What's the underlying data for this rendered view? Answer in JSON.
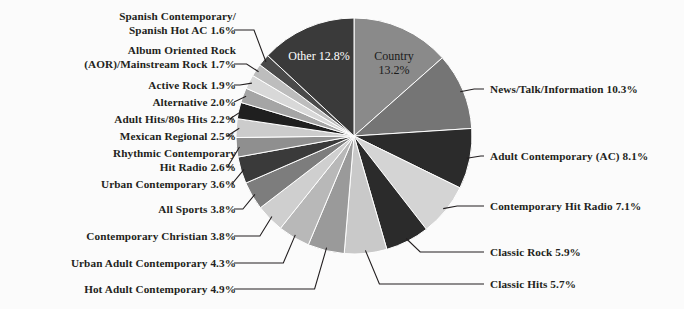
{
  "chart_data": {
    "type": "pie",
    "title": "",
    "subtitle": "",
    "xlabel": "",
    "ylabel": "",
    "legend_position": "none",
    "grid": false,
    "units": "percent",
    "background_color": "#fbfbfb",
    "text_color": "#231f20",
    "start_angle_deg": 0,
    "direction": "clockwise",
    "categories": [
      "Country",
      "News/Talk/Information",
      "Adult Contemporary (AC)",
      "Contemporary Hit Radio",
      "Classic Rock",
      "Classic Hits",
      "Hot Adult Contemporary",
      "Urban Adult Contemporary",
      "Contemporary Christian",
      "All Sports",
      "Urban Contemporary",
      "Rhythmic Contemporary Hit Radio",
      "Mexican Regional",
      "Adult Hits/80s Hits",
      "Alternative",
      "Active Rock",
      "Album Oriented Rock (AOR)/Mainstream Rock",
      "Spanish Contemporary/Spanish Hot AC",
      "Other"
    ],
    "values": [
      13.2,
      10.3,
      8.1,
      7.1,
      5.9,
      5.7,
      4.9,
      4.3,
      3.8,
      3.8,
      3.6,
      2.6,
      2.5,
      2.2,
      2.0,
      1.9,
      1.7,
      1.6,
      12.8
    ],
    "colors": [
      "#8a8a8a",
      "#757575",
      "#2b2b2b",
      "#d4d4d4",
      "#2b2b2b",
      "#c9c9c9",
      "#9a9a9a",
      "#b8b8b8",
      "#cfcfcf",
      "#7d7d7d",
      "#3a3a3a",
      "#8f8f8f",
      "#cccccc",
      "#1f1f1f",
      "#a5a5a5",
      "#d8d8d8",
      "#bdbdbd",
      "#4a4a4a",
      "#3a3a3a"
    ],
    "slices": [
      {
        "label": "Country",
        "value": 13.2,
        "display": "Country\n13.2%",
        "color": "#8a8a8a",
        "label_style": "inside-dark"
      },
      {
        "label": "News/Talk/Information",
        "value": 10.3,
        "display": "News/Talk/Information 10.3%",
        "color": "#757575",
        "label_style": "leader-right"
      },
      {
        "label": "Adult Contemporary (AC)",
        "value": 8.1,
        "display": "Adult Contemporary (AC) 8.1%",
        "color": "#2b2b2b",
        "label_style": "leader-right"
      },
      {
        "label": "Contemporary Hit Radio",
        "value": 7.1,
        "display": "Contemporary Hit Radio 7.1%",
        "color": "#d4d4d4",
        "label_style": "leader-right"
      },
      {
        "label": "Classic Rock",
        "value": 5.9,
        "display": "Classic Rock 5.9%",
        "color": "#2b2b2b",
        "label_style": "leader-right"
      },
      {
        "label": "Classic Hits",
        "value": 5.7,
        "display": "Classic Hits 5.7%",
        "color": "#c9c9c9",
        "label_style": "leader-right"
      },
      {
        "label": "Hot Adult Contemporary",
        "value": 4.9,
        "display": "Hot Adult Contemporary 4.9%",
        "color": "#9a9a9a",
        "label_style": "leader-left"
      },
      {
        "label": "Urban Adult Contemporary",
        "value": 4.3,
        "display": "Urban Adult Contemporary 4.3%",
        "color": "#b8b8b8",
        "label_style": "leader-left"
      },
      {
        "label": "Contemporary Christian",
        "value": 3.8,
        "display": "Contemporary Christian 3.8%",
        "color": "#cfcfcf",
        "label_style": "leader-left"
      },
      {
        "label": "All Sports",
        "value": 3.8,
        "display": "All Sports 3.8%",
        "color": "#7d7d7d",
        "label_style": "leader-left"
      },
      {
        "label": "Urban Contemporary",
        "value": 3.6,
        "display": "Urban Contemporary 3.6%",
        "color": "#3a3a3a",
        "label_style": "leader-left"
      },
      {
        "label": "Rhythmic Contemporary Hit Radio",
        "value": 2.6,
        "display": "Rhythmic Contemporary\nHit Radio 2.6%",
        "color": "#8f8f8f",
        "label_style": "leader-left"
      },
      {
        "label": "Mexican Regional",
        "value": 2.5,
        "display": "Mexican Regional 2.5%",
        "color": "#cccccc",
        "label_style": "leader-left"
      },
      {
        "label": "Adult Hits/80s Hits",
        "value": 2.2,
        "display": "Adult Hits/80s Hits 2.2%",
        "color": "#1f1f1f",
        "label_style": "leader-left"
      },
      {
        "label": "Alternative",
        "value": 2.0,
        "display": "Alternative 2.0%",
        "color": "#a5a5a5",
        "label_style": "leader-left"
      },
      {
        "label": "Active Rock",
        "value": 1.9,
        "display": "Active Rock 1.9%",
        "color": "#d8d8d8",
        "label_style": "leader-left"
      },
      {
        "label": "Album Oriented Rock (AOR)/Mainstream Rock",
        "value": 1.7,
        "display": "Album Oriented Rock\n(AOR)/Mainstream Rock 1.7%",
        "color": "#bdbdbd",
        "label_style": "leader-left"
      },
      {
        "label": "Spanish Contemporary/Spanish Hot AC",
        "value": 1.6,
        "display": "Spanish Contemporary/\nSpanish Hot AC 1.6%",
        "color": "#4a4a4a",
        "label_style": "leader-left"
      },
      {
        "label": "Other",
        "value": 12.8,
        "display": "Other\n12.8%",
        "color": "#3a3a3a",
        "label_style": "inside-light"
      }
    ]
  },
  "labels": {
    "spanish_contemporary": "Spanish Contemporary/\nSpanish Hot AC 1.6%",
    "aor": "Album Oriented Rock\n(AOR)/Mainstream Rock 1.7%",
    "active_rock": "Active Rock 1.9%",
    "alternative": "Alternative 2.0%",
    "adult_hits": "Adult Hits/80s Hits 2.2%",
    "mexican_regional": "Mexican Regional 2.5%",
    "rhythmic_chr": "Rhythmic Contemporary\nHit Radio 2.6%",
    "urban_contemporary": "Urban Contemporary 3.6%",
    "all_sports": "All Sports 3.8%",
    "contemporary_christian": "Contemporary Christian 3.8%",
    "urban_adult_contemporary": "Urban Adult Contemporary 4.3%",
    "hot_adult_contemporary": "Hot Adult Contemporary 4.9%",
    "news_talk": "News/Talk/Information 10.3%",
    "adult_contemporary": "Adult Contemporary (AC) 8.1%",
    "contemporary_hit_radio": "Contemporary Hit Radio 7.1%",
    "classic_rock": "Classic Rock 5.9%",
    "classic_hits": "Classic Hits 5.7%",
    "other_inside": "Other\n12.8%",
    "country_inside": "Country\n13.2%"
  }
}
